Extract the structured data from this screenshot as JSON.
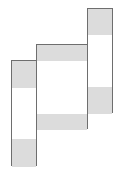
{
  "diagram": {
    "colors": {
      "border": "#6e6e6e",
      "shade": "#dcdcdc",
      "fill": "#ffffff"
    },
    "columns": [
      {
        "id": "left",
        "x": 11,
        "y": 60,
        "w": 26,
        "h": 106,
        "shades": [
          {
            "y": 0,
            "h": 27
          },
          {
            "y": 78,
            "h": 28
          }
        ]
      },
      {
        "id": "middle",
        "x": 36,
        "y": 44,
        "w": 52,
        "h": 85,
        "shades": [
          {
            "y": 0,
            "h": 16
          },
          {
            "y": 69,
            "h": 16
          }
        ]
      },
      {
        "id": "right",
        "x": 87,
        "y": 8,
        "w": 26,
        "h": 105,
        "shades": [
          {
            "y": 0,
            "h": 26
          },
          {
            "y": 78,
            "h": 27
          }
        ]
      }
    ]
  }
}
